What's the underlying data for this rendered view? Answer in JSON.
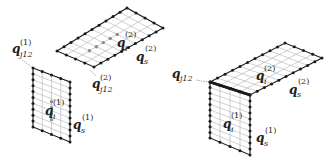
{
  "figure": {
    "left": {
      "title": "separated subdomains",
      "top_panel": {
        "interior_label": {
          "base": "q",
          "sub": "i",
          "sup": "(2)"
        },
        "side_label": {
          "base": "q",
          "sub": "s",
          "sup": "(2)"
        },
        "junction_label": {
          "base": "q",
          "sub": "j12",
          "sup": "(2)"
        }
      },
      "bottom_panel": {
        "interior_label": {
          "base": "q",
          "sub": "i",
          "sup": "(1)"
        },
        "side_label": {
          "base": "q",
          "sub": "s",
          "sup": "(1)"
        },
        "junction_label": {
          "base": "q",
          "sub": "j12",
          "sup": "(1)"
        }
      }
    },
    "right": {
      "title": "assembled subdomains",
      "junction_label": {
        "base": "q",
        "sub": "j12"
      },
      "top_panel": {
        "interior_label": {
          "base": "q",
          "sub": "i",
          "sup": "(2)"
        },
        "side_label": {
          "base": "q",
          "sub": "s",
          "sup": "(2)"
        }
      },
      "front_panel": {
        "interior_label": {
          "base": "q",
          "sub": "i",
          "sup": "(1)"
        },
        "side_label": {
          "base": "q",
          "sub": "s",
          "sup": "(1)"
        }
      }
    },
    "colors": {
      "edge": "#1a1a1a",
      "grid": "#b0b0b0",
      "node": "#1a1a1a",
      "interior_node": "#8c8c8c",
      "text": "#222222"
    }
  }
}
